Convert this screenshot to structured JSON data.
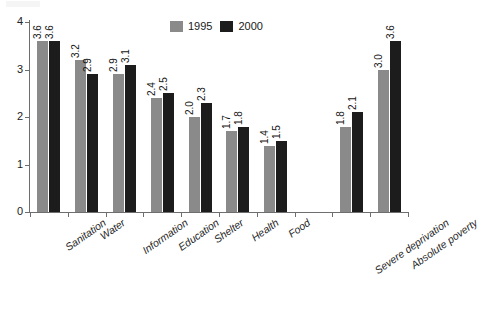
{
  "chart_data": {
    "type": "bar",
    "title": "",
    "subtitle": "",
    "xlabel": "",
    "ylabel": "",
    "ylim": [
      0,
      4
    ],
    "yticks": [
      "0",
      "1",
      "2",
      "3",
      "4"
    ],
    "grid": false,
    "legend_position": "top-center",
    "categories": [
      "Sanitation",
      "Water",
      "Information",
      "Education",
      "Shelter",
      "Health",
      "Food",
      "",
      "Severe deprivation",
      "Absolute poverty"
    ],
    "series": [
      {
        "name": "1995",
        "color": "#8a8a8a",
        "values": [
          3.6,
          3.2,
          2.9,
          2.4,
          2.0,
          1.7,
          1.4,
          null,
          1.8,
          3.0
        ],
        "labels": [
          "3.6",
          "3.2",
          "2.9",
          "2.4",
          "2.0",
          "1.7",
          "1.4",
          "",
          "1.8",
          "3.0"
        ]
      },
      {
        "name": "2000",
        "color": "#1c1c1c",
        "values": [
          3.6,
          2.9,
          3.1,
          2.5,
          2.3,
          1.8,
          1.5,
          null,
          2.1,
          3.6
        ],
        "labels": [
          "3.6",
          "2.9",
          "3.1",
          "2.5",
          "2.3",
          "1.8",
          "1.5",
          "",
          "2.1",
          "3.6"
        ]
      }
    ]
  },
  "legend": {
    "items": [
      {
        "label": "1995",
        "color": "#8a8a8a"
      },
      {
        "label": "2000",
        "color": "#1c1c1c"
      }
    ]
  },
  "axes": {
    "y": {
      "ticks": [
        "0",
        "1",
        "2",
        "3",
        "4"
      ],
      "min": 0,
      "max": 4
    }
  }
}
